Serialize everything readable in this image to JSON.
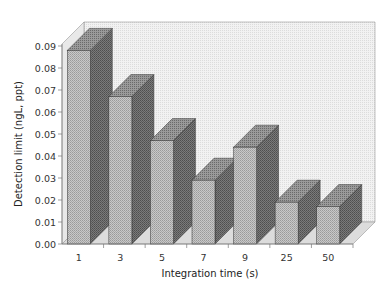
{
  "chart_data": {
    "type": "bar",
    "style": "3d",
    "title": "",
    "xlabel": "Integration time (s)",
    "ylabel": "Detection limit (ngL, ppt)",
    "categories": [
      "1",
      "3",
      "5",
      "7",
      "9",
      "25",
      "50"
    ],
    "values": [
      0.088,
      0.067,
      0.047,
      0.029,
      0.044,
      0.019,
      0.017
    ],
    "ylim": [
      0.0,
      0.09
    ],
    "yticks": [
      "0.00",
      "0.01",
      "0.02",
      "0.03",
      "0.04",
      "0.05",
      "0.06",
      "0.07",
      "0.08",
      "0.09"
    ],
    "grid": false,
    "legend": null
  },
  "colors": {
    "front": "#bdbdbd",
    "side": "#6f6f6f",
    "top": "#8c8c8c",
    "wall": "#ececec",
    "floor": "#d6d6d6"
  }
}
